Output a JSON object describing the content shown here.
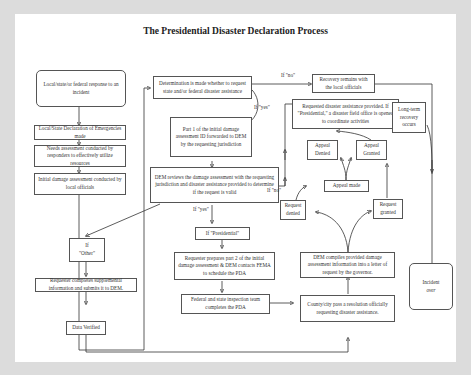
{
  "title": "The Presidential Disaster Declaration Process",
  "nodes": {
    "response": "Local/state/or federal response to an incident",
    "local_declaration": "Local/State Declaration of Emergencies made",
    "needs_assessment": "Needs assessment conducted by responders to effectively utilize resources",
    "initial_assessment": "Initial damage assessment conducted by local officials",
    "determination": "Determination is made whether to request state and/or federal disaster assistance",
    "part1": "Part 1 of the initial damage assessment ID forwarded to DEM by the requesting jurisdiction",
    "dem_reviews": "DEM reviews the damage assessment with the requesting jurisdiction and disaster assistance provided to determine if the request is valid",
    "if_presidential": "If \"Presidential\"",
    "if_other_line1": "If",
    "if_other_line2": "\"Other\"",
    "requester_supplemental": "Requester completes supplemental information and submits it to DEM.",
    "data_verified": "Data Verified",
    "requester_part2": "Requester prepares part 2 of the initial damage assessment & DEM contacts FEMA to schedule the PDA",
    "federal_state_pda": "Federal and state inspection team completes the PDA",
    "county_resolution": "County/city pass a resolution officially requesting disaster assistance.",
    "dem_compiles": "DEM compiles provided damage assessment information into a letter of request by the governor.",
    "request_denied": "Request denied",
    "request_granted": "Request granted",
    "appeal_made": "Appeal made",
    "appeal_denied": "Appeal Denied",
    "appeal_granted": "Appeal Granted",
    "assistance_provided": "Requested disaster assistance provided. If \"Presidential,\" a disaster field office is opened to coordinate activities",
    "recovery_local": "Recovery remains with the local officials",
    "long_term": "Long-term recovery occurs",
    "incident_line1": "Incident",
    "incident_line2": "over"
  },
  "edge_labels": {
    "if_no_top": "If \"no\"",
    "if_yes_top": "If \"yes\"",
    "if_no_mid": "If \"no\"",
    "if_yes_mid": "If \"yes\""
  }
}
